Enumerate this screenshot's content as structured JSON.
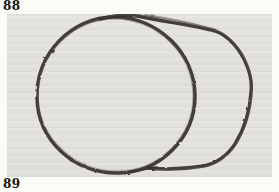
{
  "figure_top": {
    "label": "88"
  },
  "figure_bottom": {
    "label": "89"
  },
  "photo": {
    "description": "Freehand charcoal sketch of a cylinder lying on its side: a large circle as the near face, with the cylinder body sweeping right to a rounded end cap, joined by top and bottom edge strokes on gray paper",
    "paper_color": "#e5e3df",
    "ink_color": "#35302b",
    "page_background": "#fbfbf8"
  }
}
